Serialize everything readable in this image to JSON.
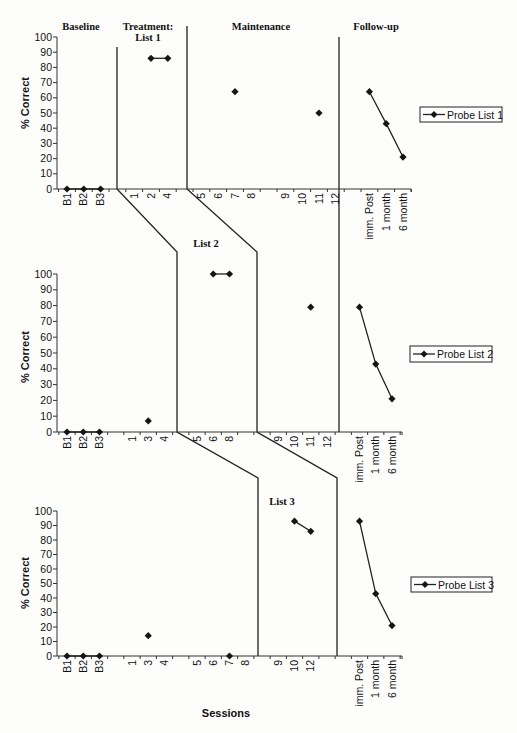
{
  "phase_headers": {
    "baseline": "Baseline",
    "treatment": "Treatment:",
    "treatment_list": "List 1",
    "maintenance": "Maintenance",
    "follow_up": "Follow-up"
  },
  "panel_labels": {
    "list2": "List 2",
    "list3": "List 3"
  },
  "axis_titles": {
    "y": "% Correct",
    "x": "Sessions"
  },
  "legends": [
    "Probe List 1",
    "Probe List 2",
    "Probe List 3"
  ],
  "colors": {
    "line": "#222222",
    "marker": "#151515",
    "background": "#fdfdfc"
  },
  "chart_data": {
    "type": "line",
    "title": "",
    "xlabel": "Sessions",
    "ylabel": "% Correct",
    "ylim": [
      0,
      100
    ],
    "yticks": [
      0,
      10,
      20,
      30,
      40,
      50,
      60,
      70,
      80,
      90,
      100
    ],
    "grid": false,
    "legend_position": "right",
    "phases": [
      "Baseline",
      "Treatment",
      "Maintenance",
      "Follow-up"
    ],
    "panels": [
      {
        "name": "Probe List 1",
        "categories": [
          {
            "label": "B1",
            "slot": 0
          },
          {
            "label": "B2",
            "slot": 1
          },
          {
            "label": "B3",
            "slot": 2
          },
          {
            "label": "1",
            "slot": 4
          },
          {
            "label": "2",
            "slot": 5
          },
          {
            "label": "4",
            "slot": 6
          },
          {
            "label": "5",
            "slot": 8
          },
          {
            "label": "6",
            "slot": 9
          },
          {
            "label": "7",
            "slot": 10
          },
          {
            "label": "8",
            "slot": 11
          },
          {
            "label": "9",
            "slot": 13
          },
          {
            "label": "10",
            "slot": 14
          },
          {
            "label": "11",
            "slot": 15
          },
          {
            "label": "12",
            "slot": 16
          },
          {
            "label": "imm. Post",
            "slot": 18
          },
          {
            "label": "1 month",
            "slot": 19
          },
          {
            "label": "6 month",
            "slot": 20
          }
        ],
        "segments": [
          {
            "phase": "Baseline",
            "connected": true,
            "points": [
              [
                "B1",
                0
              ],
              [
                "B2",
                0
              ],
              [
                "B3",
                0
              ]
            ]
          },
          {
            "phase": "Treatment",
            "connected": true,
            "points": [
              [
                "2",
                86
              ],
              [
                "4",
                86
              ]
            ]
          },
          {
            "phase": "Maintenance",
            "connected": false,
            "points": [
              [
                "7",
                64
              ],
              [
                "11",
                50
              ]
            ]
          },
          {
            "phase": "Follow-up",
            "connected": true,
            "points": [
              [
                "imm. Post",
                64
              ],
              [
                "1 month",
                43
              ],
              [
                "6 month",
                21
              ]
            ]
          }
        ]
      },
      {
        "name": "Probe List 2",
        "categories": [
          {
            "label": "B1",
            "slot": 0
          },
          {
            "label": "B2",
            "slot": 1
          },
          {
            "label": "B3",
            "slot": 2
          },
          {
            "label": "1",
            "slot": 4
          },
          {
            "label": "3",
            "slot": 5
          },
          {
            "label": "4",
            "slot": 6
          },
          {
            "label": "5",
            "slot": 8
          },
          {
            "label": "6",
            "slot": 9
          },
          {
            "label": "8",
            "slot": 10
          },
          {
            "label": "9",
            "slot": 13
          },
          {
            "label": "10",
            "slot": 14
          },
          {
            "label": "11",
            "slot": 15
          },
          {
            "label": "12",
            "slot": 16
          },
          {
            "label": "imm. Post",
            "slot": 18
          },
          {
            "label": "1 month",
            "slot": 19
          },
          {
            "label": "6 month",
            "slot": 20
          }
        ],
        "segments": [
          {
            "phase": "Baseline",
            "connected": true,
            "points": [
              [
                "B1",
                0
              ],
              [
                "B2",
                0
              ],
              [
                "B3",
                0
              ]
            ]
          },
          {
            "phase": "Baseline",
            "connected": false,
            "points": [
              [
                "3",
                7
              ]
            ]
          },
          {
            "phase": "Treatment",
            "connected": true,
            "points": [
              [
                "6",
                100
              ],
              [
                "8",
                100
              ]
            ]
          },
          {
            "phase": "Maintenance",
            "connected": false,
            "points": [
              [
                "11",
                79
              ]
            ]
          },
          {
            "phase": "Follow-up",
            "connected": true,
            "points": [
              [
                "imm. Post",
                79
              ],
              [
                "1 month",
                43
              ],
              [
                "6 month",
                21
              ]
            ]
          }
        ]
      },
      {
        "name": "Probe List 3",
        "categories": [
          {
            "label": "B1",
            "slot": 0
          },
          {
            "label": "B2",
            "slot": 1
          },
          {
            "label": "B3",
            "slot": 2
          },
          {
            "label": "1",
            "slot": 4
          },
          {
            "label": "3",
            "slot": 5
          },
          {
            "label": "4",
            "slot": 6
          },
          {
            "label": "5",
            "slot": 8
          },
          {
            "label": "6",
            "slot": 9
          },
          {
            "label": "7",
            "slot": 10
          },
          {
            "label": "8",
            "slot": 11
          },
          {
            "label": "9",
            "slot": 13
          },
          {
            "label": "10",
            "slot": 14
          },
          {
            "label": "12",
            "slot": 15
          },
          {
            "label": "imm. Post",
            "slot": 18
          },
          {
            "label": "1 month",
            "slot": 19
          },
          {
            "label": "6 month",
            "slot": 20
          }
        ],
        "segments": [
          {
            "phase": "Baseline",
            "connected": true,
            "points": [
              [
                "B1",
                0
              ],
              [
                "B2",
                0
              ],
              [
                "B3",
                0
              ]
            ]
          },
          {
            "phase": "Baseline",
            "connected": false,
            "points": [
              [
                "3",
                14
              ],
              [
                "7",
                0
              ]
            ]
          },
          {
            "phase": "Treatment",
            "connected": true,
            "points": [
              [
                "10",
                93
              ],
              [
                "12",
                86
              ]
            ]
          },
          {
            "phase": "Follow-up",
            "connected": true,
            "points": [
              [
                "imm. Post",
                93
              ],
              [
                "1 month",
                43
              ],
              [
                "6 month",
                21
              ]
            ]
          }
        ]
      }
    ]
  }
}
